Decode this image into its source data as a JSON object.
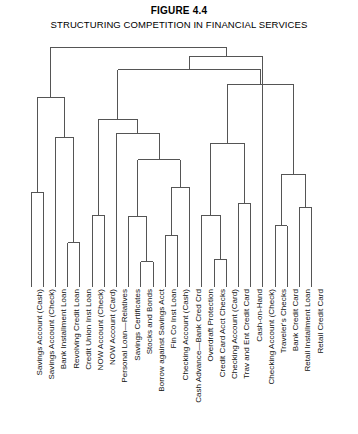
{
  "figure": {
    "number_label": "FIGURE 4.4",
    "title": "STRUCTURING COMPETITION IN FINANCIAL SERVICES"
  },
  "chart_data": {
    "type": "dendrogram",
    "title": "STRUCTURING COMPETITION IN FINANCIAL SERVICES",
    "subtitle": "FIGURE 4.4",
    "xlabel": "",
    "ylabel": "",
    "grid": false,
    "legend": "none",
    "orientation": "vertical-leaves-bottom",
    "leaf_count": 24,
    "line_color": "#555555",
    "leaves": [
      "Savings Account (Cash)",
      "Savings Account (Check)",
      "Bank Installment Loan",
      "Revolving Credit Loan",
      "Credit Union Inst Loan",
      "NOW Account (Check)",
      "NOW Account (Card)",
      "Personal Loan—Relatives",
      "Savings Certificates",
      "Stocks and Bonds",
      "Borrow against Savings Acct",
      "Fin Co Inst Loan",
      "Checking Account (Cash)",
      "Cash Advance—Bank Cred Crd",
      "Overdraft Protection",
      "Credit Card Acct Checks",
      "Checking Account (Card)",
      "Trav and Ent Credit Card",
      "Cash-on-Hand",
      "Checking Account (Check)",
      "Traveler's Checks",
      "Bank Credit Card",
      "Retail Installment Loan",
      "Retail Credit Card"
    ],
    "merges": [
      {
        "id": "m1",
        "left": "leaf:0",
        "right": "leaf:1",
        "height": 0.395
      },
      {
        "id": "m2",
        "left": "leaf:3",
        "right": "leaf:4",
        "height": 0.185
      },
      {
        "id": "m3",
        "left": "leaf:2",
        "right": "m2",
        "height": 0.625
      },
      {
        "id": "m4",
        "left": "m1",
        "right": "m3",
        "height": 0.79
      },
      {
        "id": "m5",
        "left": "leaf:5",
        "right": "leaf:6",
        "height": 0.3
      },
      {
        "id": "m6",
        "left": "leaf:9",
        "right": "leaf:10",
        "height": 0.105
      },
      {
        "id": "m7",
        "left": "leaf:8",
        "right": "m6",
        "height": 0.295
      },
      {
        "id": "m8",
        "left": "leaf:11",
        "right": "leaf:12",
        "height": 0.215
      },
      {
        "id": "m9",
        "left": "m8",
        "right": "leaf:13",
        "height": 0.415
      },
      {
        "id": "m10",
        "left": "m7",
        "right": "m9",
        "height": 0.53
      },
      {
        "id": "m11",
        "left": "leaf:7",
        "right": "m10",
        "height": 0.64
      },
      {
        "id": "m12",
        "left": "m5",
        "right": "m11",
        "height": 0.7
      },
      {
        "id": "m13",
        "left": "leaf:15",
        "right": "leaf:16",
        "height": 0.115
      },
      {
        "id": "m14",
        "left": "leaf:14",
        "right": "m13",
        "height": 0.3
      },
      {
        "id": "m15",
        "left": "leaf:20",
        "right": "leaf:21",
        "height": 0.255
      },
      {
        "id": "m16",
        "left": "leaf:22",
        "right": "leaf:23",
        "height": 0.33
      },
      {
        "id": "m17",
        "left": "m15",
        "right": "m16",
        "height": 0.47
      },
      {
        "id": "m18",
        "left": "leaf:17",
        "right": "leaf:18",
        "height": 0.35
      },
      {
        "id": "m19",
        "left": "m14",
        "right": "m18",
        "height": 0.6
      },
      {
        "id": "m20",
        "left": "m19",
        "right": "m17",
        "height": 0.845
      },
      {
        "id": "m21",
        "left": "m12",
        "right": "m20",
        "height": 0.905
      },
      {
        "id": "m22",
        "left": "leaf:19",
        "right": "m21",
        "height": 0.96
      },
      {
        "id": "m23",
        "left": "m4",
        "right": "m22",
        "height": 1.0
      }
    ]
  }
}
